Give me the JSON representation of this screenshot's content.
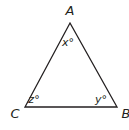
{
  "diagram": {
    "type": "triangle",
    "stroke_color": "#231f20",
    "vertices": [
      {
        "name": "A",
        "x": 70,
        "y": 23,
        "label_x": 70,
        "label_y": 15,
        "anchor": "middle"
      },
      {
        "name": "B",
        "x": 117,
        "y": 107,
        "label_x": 126,
        "label_y": 118,
        "anchor": "middle"
      },
      {
        "name": "C",
        "x": 25,
        "y": 107,
        "label_x": 15,
        "label_y": 118,
        "anchor": "middle"
      }
    ],
    "angles": [
      {
        "vertex": "A",
        "label": "x°",
        "x": 68,
        "y": 46
      },
      {
        "vertex": "B",
        "label": "y°",
        "x": 101,
        "y": 103
      },
      {
        "vertex": "C",
        "label": "z°",
        "x": 34,
        "y": 103
      }
    ]
  }
}
